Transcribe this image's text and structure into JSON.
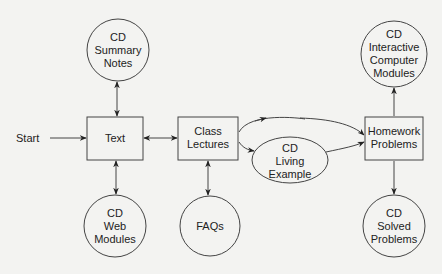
{
  "diagram": {
    "start_label": "Start",
    "nodes": {
      "summary_notes": {
        "shape": "circle",
        "lines": [
          "CD",
          "Summary",
          "Notes"
        ]
      },
      "text": {
        "shape": "box",
        "lines": [
          "Text"
        ]
      },
      "web_modules": {
        "shape": "circle",
        "lines": [
          "CD",
          "Web",
          "Modules"
        ]
      },
      "class_lectures": {
        "shape": "box",
        "lines": [
          "Class",
          "Lectures"
        ]
      },
      "faqs": {
        "shape": "circle",
        "lines": [
          "FAQs"
        ]
      },
      "living_example": {
        "shape": "ellipse",
        "lines": [
          "CD",
          "Living",
          "Example"
        ]
      },
      "homework_problems": {
        "shape": "box",
        "lines": [
          "Homework",
          "Problems"
        ]
      },
      "interactive_modules": {
        "shape": "circle",
        "lines": [
          "CD",
          "Interactive",
          "Computer",
          "Modules"
        ]
      },
      "solved_problems": {
        "shape": "circle",
        "lines": [
          "CD",
          "Solved",
          "Problems"
        ]
      }
    },
    "edges": [
      {
        "from": "start",
        "to": "text",
        "type": "directed"
      },
      {
        "from": "text",
        "to": "summary_notes",
        "type": "bidirectional"
      },
      {
        "from": "text",
        "to": "web_modules",
        "type": "bidirectional"
      },
      {
        "from": "text",
        "to": "class_lectures",
        "type": "bidirectional"
      },
      {
        "from": "class_lectures",
        "to": "faqs",
        "type": "bidirectional"
      },
      {
        "from": "class_lectures",
        "to": "living_example",
        "type": "directed"
      },
      {
        "from": "class_lectures",
        "to": "homework_problems",
        "type": "directed"
      },
      {
        "from": "living_example",
        "to": "homework_problems",
        "type": "directed"
      },
      {
        "from": "homework_problems",
        "to": "interactive_modules",
        "type": "directed"
      },
      {
        "from": "homework_problems",
        "to": "solved_problems",
        "type": "directed"
      }
    ],
    "colors": {
      "stroke": "#333333",
      "background": "#f3f3f1",
      "text": "#222222"
    }
  }
}
